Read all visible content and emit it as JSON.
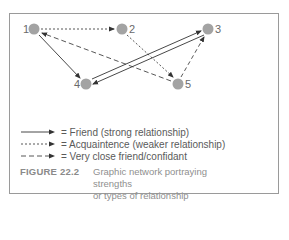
{
  "figure": {
    "label": "FIGURE 22.2",
    "caption": "Graphic network portraying strengths or types of relationship",
    "caption_line1": "Graphic network portraying strengths",
    "caption_line2": "or types of relationship"
  },
  "nodes": [
    {
      "id": "1",
      "label": "1",
      "x": 34,
      "y": 29,
      "label_side": "left"
    },
    {
      "id": "2",
      "label": "2",
      "x": 122,
      "y": 29,
      "label_side": "right"
    },
    {
      "id": "3",
      "label": "3",
      "x": 208,
      "y": 29,
      "label_side": "right"
    },
    {
      "id": "4",
      "label": "4",
      "x": 86,
      "y": 84,
      "label_side": "left"
    },
    {
      "id": "5",
      "label": "5",
      "x": 178,
      "y": 84,
      "label_side": "right"
    }
  ],
  "edges": [
    {
      "from": "1",
      "to": "2",
      "type": "acquaintance"
    },
    {
      "from": "1",
      "to": "4",
      "type": "friend"
    },
    {
      "from": "5",
      "to": "1",
      "type": "confidant"
    },
    {
      "from": "2",
      "to": "5",
      "type": "acquaintance"
    },
    {
      "from": "4",
      "to": "3",
      "type": "friend"
    },
    {
      "from": "3",
      "to": "4",
      "type": "friend"
    },
    {
      "from": "5",
      "to": "3",
      "type": "confidant"
    }
  ],
  "legend": [
    {
      "type": "friend",
      "line_style": "solid",
      "text": "= Friend (strong relationship)"
    },
    {
      "type": "acquaintance",
      "line_style": "dotted",
      "text": "= Acquaintence (weaker relationship)"
    },
    {
      "type": "confidant",
      "line_style": "dashed",
      "text": "= Very close friend/confidant"
    }
  ],
  "colors": {
    "node": "#a3a3a3",
    "edge": "#3a3a3a",
    "border": "#9a9a9a",
    "caption_label": "#8a8a8a",
    "caption_text": "#8f8f8f"
  }
}
